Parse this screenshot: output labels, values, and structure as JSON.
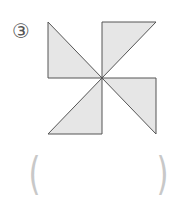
{
  "problem": {
    "number_label": "③",
    "figure": {
      "description": "pinwheel made of four right triangles meeting at a center point",
      "fill_color": "#e6e6e6",
      "stroke_color": "#555555"
    },
    "answer": {
      "open_paren": "(",
      "close_paren": ")",
      "value": ""
    }
  }
}
